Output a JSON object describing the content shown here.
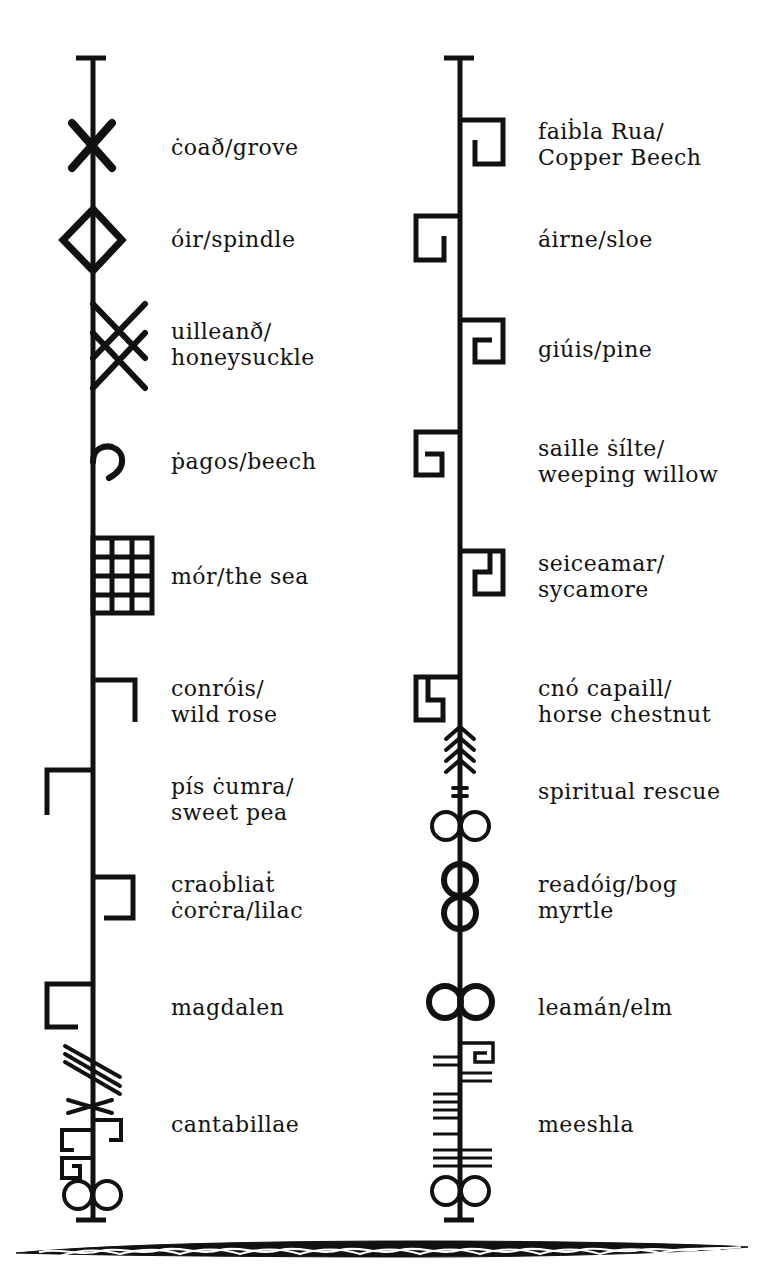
{
  "colors": {
    "ink": "#111111",
    "paper": "#ffffff"
  },
  "columns": [
    {
      "id": "left",
      "entries": [
        {
          "symbol": "x-cross",
          "lines": [
            "ċoað/grove"
          ],
          "y": 148
        },
        {
          "symbol": "diamond",
          "lines": [
            "óir/spindle"
          ],
          "y": 240
        },
        {
          "symbol": "double-cross",
          "lines": [
            "uilleanð/",
            "honeysuckle"
          ],
          "y": 345
        },
        {
          "symbol": "hook",
          "lines": [
            "ṗagos/beech"
          ],
          "y": 462
        },
        {
          "symbol": "grid",
          "lines": [
            "mór/the sea"
          ],
          "y": 577
        },
        {
          "symbol": "right-hook-down",
          "lines": [
            "conróis/",
            "wild rose"
          ],
          "y": 702
        },
        {
          "symbol": "left-hook-down",
          "lines": [
            "pís ċumra/",
            "sweet pea"
          ],
          "y": 800
        },
        {
          "symbol": "right-bracket",
          "lines": [
            "craoḃliaṫ",
            "ċorċra/lilac"
          ],
          "y": 898
        },
        {
          "symbol": "left-bracket",
          "lines": [
            "magdalen"
          ],
          "y": 1008
        },
        {
          "symbol": "composite",
          "lines": [
            "cantabillae"
          ],
          "y": 1125
        }
      ]
    },
    {
      "id": "right",
      "entries": [
        {
          "symbol": "spiral-right",
          "lines": [
            "faiḃla Rua/",
            "Copper Beech"
          ],
          "y": 145
        },
        {
          "symbol": "spiral-left",
          "lines": [
            "áirne/sloe"
          ],
          "y": 240
        },
        {
          "symbol": "spiral-right-tight",
          "lines": [
            "giúis/pine"
          ],
          "y": 350
        },
        {
          "symbol": "spiral-left-tight",
          "lines": [
            "saille ṡílte/",
            "weeping willow"
          ],
          "y": 462
        },
        {
          "symbol": "step-right",
          "lines": [
            "seiceamar/",
            "sycamore"
          ],
          "y": 577
        },
        {
          "symbol": "step-left",
          "lines": [
            "cnó capaill/",
            "horse chestnut"
          ],
          "y": 702
        },
        {
          "symbol": "arrow-circles",
          "lines": [
            "spiritual rescue"
          ],
          "y": 792
        },
        {
          "symbol": "double-rings",
          "lines": [
            "readóig/bog",
            "myrtle"
          ],
          "y": 898
        },
        {
          "symbol": "bold-rings",
          "lines": [
            "leamán/elm"
          ],
          "y": 1008
        },
        {
          "symbol": "ogham-lines",
          "lines": [
            "meeshla"
          ],
          "y": 1125
        }
      ]
    }
  ],
  "footer": {
    "ornament": "celtic-knot-border"
  }
}
